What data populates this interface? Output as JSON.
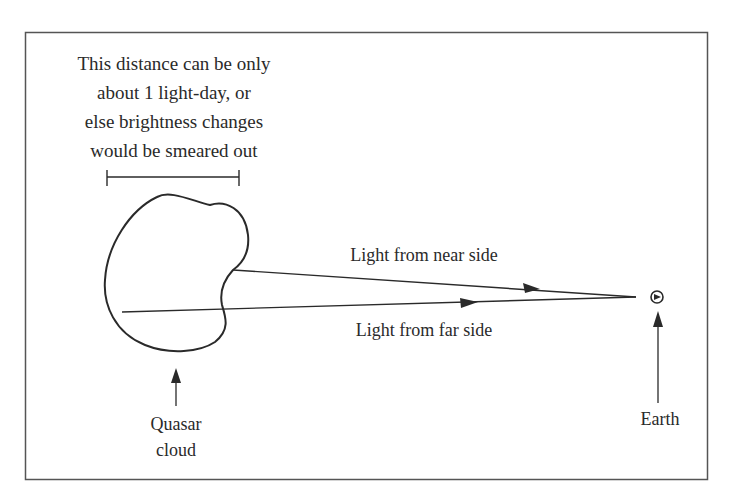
{
  "diagram": {
    "caption_top": [
      "This distance can be only",
      "about 1 light-day, or",
      "else brightness changes",
      "would be smeared out"
    ],
    "near_ray_label": "Light from near side",
    "far_ray_label": "Light from far side",
    "quasar_label": [
      "Quasar",
      "cloud"
    ],
    "earth_label": "Earth",
    "icons": {
      "earth": "earth-symbol-icon",
      "arrow": "arrow-up-icon"
    },
    "colors": {
      "stroke": "#2a2a2a",
      "border": "#555555",
      "background": "#ffffff"
    }
  }
}
